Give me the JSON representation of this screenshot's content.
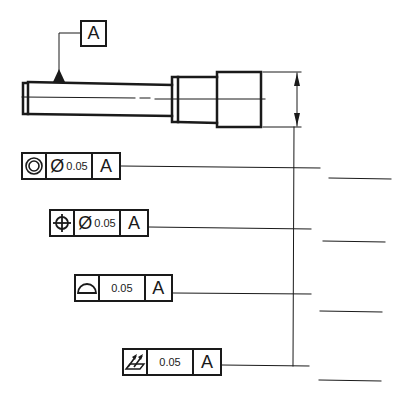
{
  "datum_feature": {
    "label": "A"
  },
  "feature_control_frames": [
    {
      "symbol": "concentricity-icon",
      "diameter_symbol": "Ø",
      "tolerance": "0.05",
      "datum": "A"
    },
    {
      "symbol": "position-icon",
      "diameter_symbol": "Ø",
      "tolerance": "0.05",
      "datum": "A"
    },
    {
      "symbol": "profile-of-surface-icon",
      "diameter_symbol": "",
      "tolerance": "0.05",
      "datum": "A"
    },
    {
      "symbol": "total-runout-icon",
      "diameter_symbol": "",
      "tolerance": "0.05",
      "datum": "A"
    }
  ],
  "colors": {
    "line": "#1a1a1a",
    "background": "#ffffff"
  }
}
